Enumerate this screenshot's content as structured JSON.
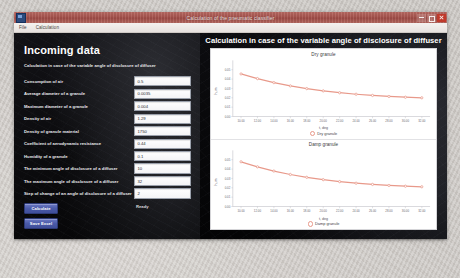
{
  "window": {
    "title": "Calculation of the pneumatic classifier",
    "menu": [
      "File",
      "Calculation"
    ],
    "controls": {
      "minimize": "minimize",
      "maximize": "maximize",
      "close": "close"
    }
  },
  "left_panel": {
    "heading": "Incoming data",
    "subheading": "Calculation in case of the variable angle of disclosure of diffuser",
    "fields": [
      {
        "label": "Consumption of air",
        "value": "0.5"
      },
      {
        "label": "Average diameter of a granule",
        "value": "0.0035"
      },
      {
        "label": "Maximum diameter of a granule",
        "value": "0.004"
      },
      {
        "label": "Density of air",
        "value": "1.29"
      },
      {
        "label": "Density of granule material",
        "value": "1750"
      },
      {
        "label": "Coefficient of aerodynamic resistance",
        "value": "0.44"
      },
      {
        "label": "Humidity of a granule",
        "value": "0.1"
      },
      {
        "label": "The minimum angle of disclosure of a diffuser",
        "value": "10"
      },
      {
        "label": "The maximum angle of disclosure of a diffuser",
        "value": "32"
      },
      {
        "label": "Step of change of an angle of disclosure of a diffuser",
        "value": "2"
      }
    ],
    "buttons": [
      {
        "label": "Calculate",
        "name": "calculate-button"
      },
      {
        "label": "Save Excel",
        "name": "save-excel-button"
      }
    ],
    "status": "Ready"
  },
  "right_panel": {
    "title": "Calculation in case of the variable angle of disclosure of diffuser"
  },
  "chart_data": [
    {
      "type": "line",
      "title": "Dry granule",
      "xlabel": "t, deg",
      "ylabel": "h, m",
      "legend": [
        "Dry granule"
      ],
      "legend_position": "bottom",
      "grid": false,
      "xlim": [
        9,
        33
      ],
      "ylim": [
        0.0,
        0.06
      ],
      "xticks": [
        10,
        12,
        14,
        16,
        18,
        20,
        22,
        24,
        26,
        28,
        30,
        32
      ],
      "xticklabels": [
        "10.00",
        "12.00",
        "14.00",
        "16.00",
        "18.00",
        "20.00",
        "22.00",
        "24.00",
        "26.00",
        "28.00",
        "30.00",
        "32.00"
      ],
      "yticks": [
        0.0,
        0.01,
        0.02,
        0.03,
        0.04,
        0.05
      ],
      "yticklabels": [
        "0.00",
        "0.01",
        "0.02",
        "0.03",
        "0.04",
        "0.05"
      ],
      "x": [
        10,
        12,
        14,
        16,
        18,
        20,
        22,
        24,
        26,
        28,
        30,
        32
      ],
      "y": [
        0.0455,
        0.0405,
        0.0362,
        0.0327,
        0.0298,
        0.0274,
        0.0254,
        0.0238,
        0.0225,
        0.0214,
        0.0206,
        0.02
      ],
      "series_color": "#e8998a"
    },
    {
      "type": "line",
      "title": "Damp granule",
      "xlabel": "t, deg",
      "ylabel": "h, m",
      "legend": [
        "Damp granule"
      ],
      "legend_position": "bottom",
      "grid": false,
      "xlim": [
        9,
        33
      ],
      "ylim": [
        0.0,
        0.06
      ],
      "xticks": [
        10,
        12,
        14,
        16,
        18,
        20,
        22,
        24,
        26,
        28,
        30,
        32
      ],
      "xticklabels": [
        "10.00",
        "12.00",
        "14.00",
        "16.00",
        "18.00",
        "20.00",
        "22.00",
        "24.00",
        "26.00",
        "28.00",
        "30.00",
        "32.00"
      ],
      "yticks": [
        0.0,
        0.01,
        0.02,
        0.03,
        0.04,
        0.05
      ],
      "yticklabels": [
        "0.00",
        "0.01",
        "0.02",
        "0.03",
        "0.04",
        "0.05"
      ],
      "x": [
        10,
        12,
        14,
        16,
        18,
        20,
        22,
        24,
        26,
        28,
        30,
        32
      ],
      "y": [
        0.0478,
        0.0424,
        0.0379,
        0.0342,
        0.0312,
        0.0287,
        0.0266,
        0.0249,
        0.0236,
        0.0225,
        0.0217,
        0.0211
      ],
      "series_color": "#e8998a"
    }
  ]
}
